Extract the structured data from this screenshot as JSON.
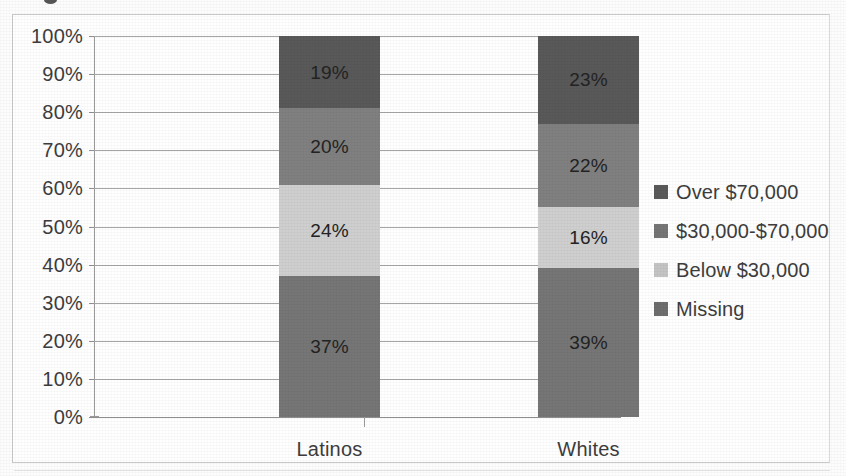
{
  "chart_data": {
    "type": "bar",
    "subtype": "100% stacked column",
    "title": "",
    "xlabel": "",
    "ylabel": "",
    "categories": [
      "Latinos",
      "Whites"
    ],
    "ylim": [
      0,
      100
    ],
    "ytick_labels": [
      "100%",
      "90%",
      "80%",
      "70%",
      "60%",
      "50%",
      "40%",
      "30%",
      "20%",
      "10%",
      "0%"
    ],
    "ytick_values": [
      100,
      90,
      80,
      70,
      60,
      50,
      40,
      30,
      20,
      10,
      0
    ],
    "grid": true,
    "legend_position": "right",
    "stack_order_bottom_to_top": [
      "Missing",
      "Below $30,000",
      "$30,000-$70,000",
      "Over $70,000"
    ],
    "series": [
      {
        "name": "Over $70,000",
        "color": "#595959",
        "values": [
          19,
          23
        ],
        "labels": [
          "19%",
          "23%"
        ]
      },
      {
        "name": "$30,000-$70,000",
        "color": "#808080",
        "values": [
          20,
          22
        ],
        "labels": [
          "20%",
          "22%"
        ]
      },
      {
        "name": "Below $30,000",
        "color": "#cfcfcf",
        "values": [
          24,
          16
        ],
        "labels": [
          "24%",
          "16%"
        ]
      },
      {
        "name": "Missing",
        "color": "#767676",
        "values": [
          37,
          39
        ],
        "labels": [
          "37%",
          "39%"
        ]
      }
    ]
  },
  "legend": {
    "items": [
      {
        "label": "Over $70,000",
        "color": "#595959"
      },
      {
        "label": "$30,000-$70,000",
        "color": "#757575"
      },
      {
        "label": "Below $30,000",
        "color": "#c4c4c4"
      },
      {
        "label": "Missing",
        "color": "#6e6e6e"
      }
    ]
  },
  "axes": {
    "y_labels": [
      "100%",
      "90%",
      "80%",
      "70%",
      "60%",
      "50%",
      "40%",
      "30%",
      "20%",
      "10%",
      "0%"
    ],
    "x_labels": [
      "Latinos",
      "Whites"
    ]
  }
}
